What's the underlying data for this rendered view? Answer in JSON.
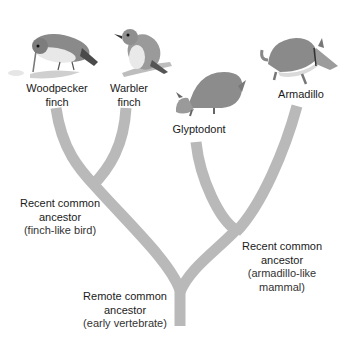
{
  "diagram": {
    "type": "phylogenetic-tree",
    "branch_color": "#b9b9b9",
    "taxa": [
      {
        "id": "woodpecker-finch",
        "lines": [
          "Woodpecker",
          "finch"
        ]
      },
      {
        "id": "warbler-finch",
        "lines": [
          "Warbler",
          "finch"
        ]
      },
      {
        "id": "glyptodont",
        "lines": [
          "Glyptodont"
        ]
      },
      {
        "id": "armadillo",
        "lines": [
          "Armadillo"
        ]
      }
    ],
    "nodes": [
      {
        "id": "recent-bird",
        "lines": [
          "Recent common",
          "ancestor"
        ],
        "note": "(finch-like bird)"
      },
      {
        "id": "recent-mammal",
        "lines": [
          "Recent common",
          "ancestor"
        ],
        "note": "(armadillo-like",
        "note2": "mammal)"
      },
      {
        "id": "remote",
        "lines": [
          "Remote common",
          "ancestor"
        ],
        "note": "(early vertebrate)"
      }
    ]
  }
}
